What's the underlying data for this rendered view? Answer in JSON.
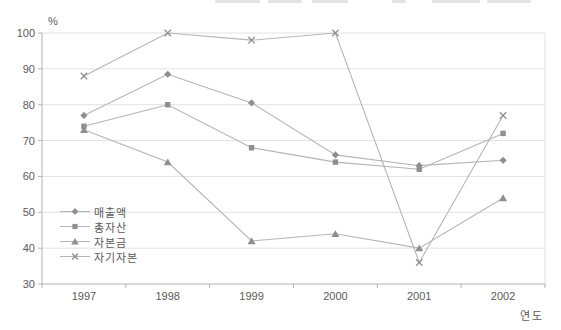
{
  "unit_label": "%",
  "chart_data": {
    "type": "line",
    "title": "",
    "xlabel": "연도",
    "ylabel": "%",
    "categories": [
      "1997",
      "1998",
      "1999",
      "2000",
      "2001",
      "2002"
    ],
    "ylim": [
      30,
      100
    ],
    "ytick_step": 10,
    "grid": true,
    "legend_position": "inside-left",
    "series": [
      {
        "name": "매출액",
        "marker": "diamond",
        "values": [
          77,
          88.5,
          80.5,
          66,
          63,
          64.5
        ]
      },
      {
        "name": "총자산",
        "marker": "square",
        "values": [
          74,
          80,
          68,
          64,
          62,
          72
        ]
      },
      {
        "name": "자본금",
        "marker": "triangle",
        "values": [
          73,
          64,
          42,
          44,
          40,
          54
        ]
      },
      {
        "name": "자기자본",
        "marker": "x",
        "values": [
          88,
          100,
          98,
          100,
          36,
          77
        ]
      }
    ]
  },
  "colors": {
    "background": "#ffffff",
    "line": "#b5b5b5",
    "marker": "#8f8f8f",
    "grid": "#e2e2e2",
    "axis": "#b3b3b3",
    "text": "#5a5a5a"
  }
}
